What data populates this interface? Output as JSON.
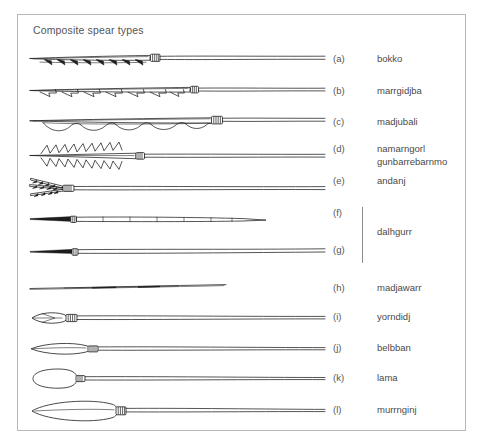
{
  "figure": {
    "title": "Composite spear types",
    "frame": {
      "border_color": "#b9b9b9",
      "background": "#ffffff"
    },
    "ink_color": "#1c1c1c",
    "text_color": "#4a4a4a"
  },
  "rows": [
    {
      "letter": "(a)",
      "name": "bokko",
      "y": 60,
      "type": "multi-barbed-single-row",
      "shaft_end": 325,
      "binding_x": 155
    },
    {
      "letter": "(b)",
      "name": "marrgidjba",
      "y": 92,
      "type": "hooked-barb-row",
      "shaft_end": 325,
      "binding_x": 193
    },
    {
      "letter": "(c)",
      "name": "madjubali",
      "y": 123,
      "type": "wave-barb-row",
      "shaft_end": 325,
      "binding_x": 214
    },
    {
      "letter": "(d)",
      "name": "namarngorl\ngunbarrebarnmo",
      "y": 156,
      "type": "double-zigzag-barbs",
      "shaft_end": 325,
      "binding_x": 139
    },
    {
      "letter": "(e)",
      "name": "andanj",
      "y": 188,
      "type": "multi-prong",
      "shaft_end": 325,
      "binding_x": 63
    },
    {
      "letter": "(f)",
      "name": "",
      "y": 220,
      "type": "segmented-shaft",
      "shaft_end": 267,
      "binding_x": 73
    },
    {
      "letter": "(g)",
      "name": "",
      "y": 251,
      "type": "plain-tapered",
      "shaft_end": 325,
      "binding_x": 75
    },
    {
      "letter": "(h)",
      "name": "madjawarr",
      "y": 289,
      "type": "plain-thin",
      "shaft_end": 226,
      "binding_x": 0
    },
    {
      "letter": "(i)",
      "name": "yorndidj",
      "y": 318,
      "type": "leaf-point-small",
      "shaft_end": 325,
      "binding_x": 66
    },
    {
      "letter": "(j)",
      "name": "belbban",
      "y": 349,
      "type": "leaf-point-medium",
      "shaft_end": 325,
      "binding_x": 88
    },
    {
      "letter": "(k)",
      "name": "lama",
      "y": 379,
      "type": "teardrop-point",
      "shaft_end": 325,
      "binding_x": 76
    },
    {
      "letter": "(l)",
      "name": "murrnginj",
      "y": 411,
      "type": "long-blade-point",
      "shaft_end": 325,
      "binding_x": 115
    }
  ],
  "grouped_label": {
    "name": "dalhgurr",
    "members": [
      "(f)",
      "(g)"
    ],
    "bracket": {
      "x": 362,
      "top": 207,
      "height": 56
    }
  },
  "layout": {
    "letter_column_x": 333,
    "name_column_x": 377,
    "grouped_name_x": 377,
    "grouped_name_y": 232
  }
}
